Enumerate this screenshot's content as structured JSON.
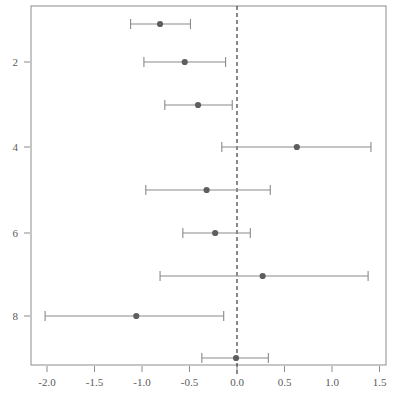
{
  "chart_data": {
    "type": "scatter",
    "subtype": "forest-plot",
    "title": "",
    "subtitle": "",
    "xlabel": "",
    "ylabel": "",
    "xlim": [
      -2.25,
      1.58
    ],
    "ylim": [
      0.4,
      9.6
    ],
    "grid": false,
    "legend": null,
    "reference_line": {
      "x": 0.0,
      "style": "dashed",
      "color": "#2b2b2b"
    },
    "x_ticks": [
      -2.0,
      -1.5,
      -1.0,
      -0.5,
      0.0,
      0.5,
      1.0,
      1.5
    ],
    "x_tick_labels": [
      "-2.0",
      "-1.5",
      "-1.0",
      "-0.5",
      "0.0",
      "0.5",
      "1.0",
      "1.5"
    ],
    "y_ticks": [
      2,
      4,
      6,
      8
    ],
    "y_tick_labels": [
      "2",
      "4",
      "6",
      "8"
    ],
    "y_axis_inverted": true,
    "point_color": "#5e5e5e",
    "interval_color": "#8a8a8a",
    "frame_color": "#8c8c8c",
    "categories": [
      "1",
      "2",
      "3",
      "4",
      "5",
      "6",
      "7",
      "8",
      "9"
    ],
    "series": [
      {
        "name": "Effect estimate with 95% CI",
        "estimates": [
          -0.81,
          -0.55,
          -0.41,
          0.63,
          -0.32,
          -0.23,
          0.27,
          -1.06,
          -0.01
        ],
        "ci_lower": [
          -1.12,
          -0.98,
          -0.76,
          -0.16,
          -0.96,
          -0.57,
          -0.81,
          -2.02,
          -0.37
        ],
        "ci_upper": [
          -0.49,
          -0.12,
          -0.05,
          1.41,
          0.35,
          0.14,
          1.38,
          -0.14,
          0.33
        ]
      }
    ],
    "rows": [
      {
        "index": 1,
        "estimate": -0.81,
        "lower": -1.12,
        "upper": -0.49
      },
      {
        "index": 2,
        "estimate": -0.55,
        "lower": -0.98,
        "upper": -0.12
      },
      {
        "index": 3,
        "estimate": -0.41,
        "lower": -0.76,
        "upper": -0.05
      },
      {
        "index": 4,
        "estimate": 0.63,
        "lower": -0.16,
        "upper": 1.41
      },
      {
        "index": 5,
        "estimate": -0.32,
        "lower": -0.96,
        "upper": 0.35
      },
      {
        "index": 6,
        "estimate": -0.23,
        "lower": -0.57,
        "upper": 0.14
      },
      {
        "index": 7,
        "estimate": 0.27,
        "lower": -0.81,
        "upper": 1.38
      },
      {
        "index": 8,
        "estimate": -1.06,
        "lower": -2.02,
        "upper": -0.14
      },
      {
        "index": 9,
        "estimate": -0.01,
        "lower": -0.37,
        "upper": 0.33
      }
    ]
  },
  "plot_geometry": {
    "frame_left": 31,
    "frame_right": 386,
    "frame_top": 6,
    "frame_bottom": 365,
    "x_zero_px": 237,
    "px_per_unit": 95,
    "row_y_px": [
      24,
      62,
      105,
      147,
      190,
      233,
      276,
      316,
      358
    ]
  }
}
